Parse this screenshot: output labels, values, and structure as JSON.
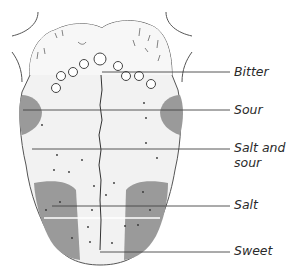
{
  "diagram": {
    "colors": {
      "outline": "#555555",
      "tongue_fill": "#f1f1f1",
      "back_fill": "#f6f6f6",
      "zone_fill": "#9a9a9a",
      "leader_line": "#444444",
      "text": "#2a2a2a"
    },
    "labels": [
      {
        "id": "bitter",
        "text": "Bitter"
      },
      {
        "id": "sour",
        "text": "Sour"
      },
      {
        "id": "salt-and-sour-1",
        "text": "Salt and"
      },
      {
        "id": "salt-and-sour-2",
        "text": "sour"
      },
      {
        "id": "salt",
        "text": "Salt"
      },
      {
        "id": "sweet",
        "text": "Sweet"
      }
    ]
  }
}
